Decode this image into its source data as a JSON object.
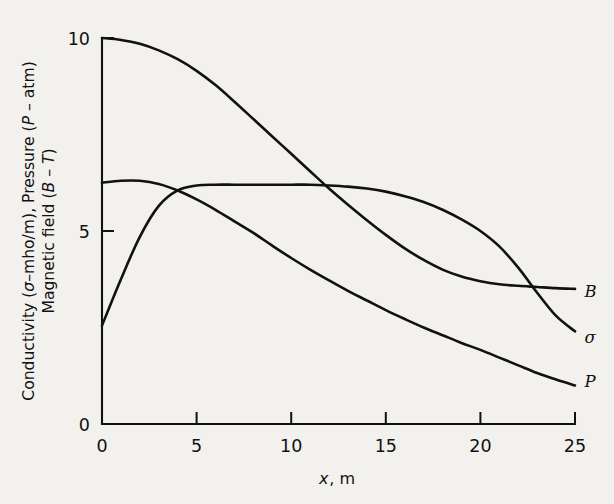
{
  "figure": {
    "background_color": "#f3f1ed",
    "ink_color": "#111111"
  },
  "axis": {
    "x_label_variable": "x",
    "x_label_unit": ", m",
    "x_tick_labels": [
      "0",
      "5",
      "10",
      "15",
      "20",
      "25"
    ],
    "y_tick_labels": [
      "0",
      "5",
      "10"
    ],
    "y_label_line1_part1": "Conductivity (",
    "y_label_line1_sigma": "σ",
    "y_label_line1_part2": "–mho/m), Pressure (",
    "y_label_line1_P": "P",
    "y_label_line1_part3": " – atm)",
    "y_label_line2_part1": "Magnetic field (",
    "y_label_line2_B": "B",
    "y_label_line2_part2": " – ",
    "y_label_line2_T": "T",
    "y_label_line2_part3": ")"
  },
  "curve_labels": {
    "B": "B",
    "sigma": "σ",
    "P": "P"
  },
  "chart_data": {
    "type": "line",
    "title": "",
    "xlabel": "x, m",
    "ylabel": "Conductivity (σ–mho/m), Pressure (P – atm) Magnetic field (B – T)",
    "xlim": [
      0,
      25
    ],
    "ylim": [
      0,
      10
    ],
    "xticks": [
      0,
      5,
      10,
      15,
      20,
      25
    ],
    "yticks": [
      0,
      5,
      10
    ],
    "grid": false,
    "legend": "inline-right-of-curve-ends",
    "series": [
      {
        "name": "B",
        "description": "Magnetic field (B – T)",
        "x": [
          0,
          1,
          2,
          3,
          4,
          5,
          6,
          7,
          8,
          9,
          10,
          11,
          12,
          13,
          14,
          15,
          16,
          17,
          18,
          19,
          20,
          21,
          22,
          23,
          24,
          25
        ],
        "values": [
          10.0,
          9.95,
          9.85,
          9.68,
          9.45,
          9.15,
          8.78,
          8.35,
          7.9,
          7.45,
          7.0,
          6.55,
          6.1,
          5.68,
          5.28,
          4.9,
          4.55,
          4.25,
          4.0,
          3.82,
          3.7,
          3.62,
          3.58,
          3.55,
          3.52,
          3.5
        ]
      },
      {
        "name": "P",
        "description": "Pressure (P – atm)",
        "x": [
          0,
          1,
          2,
          3,
          4,
          5,
          6,
          7,
          8,
          9,
          10,
          11,
          12,
          13,
          14,
          15,
          16,
          17,
          18,
          19,
          20,
          21,
          22,
          23,
          24,
          25
        ],
        "values": [
          6.25,
          6.3,
          6.3,
          6.22,
          6.05,
          5.82,
          5.55,
          5.25,
          4.95,
          4.62,
          4.3,
          4.0,
          3.72,
          3.45,
          3.2,
          2.95,
          2.72,
          2.5,
          2.3,
          2.1,
          1.92,
          1.72,
          1.52,
          1.32,
          1.15,
          1.0
        ]
      },
      {
        "name": "sigma",
        "description": "Conductivity (σ–mho/m)",
        "x": [
          0,
          1,
          2,
          3,
          4,
          5,
          6,
          7,
          8,
          9,
          10,
          11,
          12,
          13,
          14,
          15,
          16,
          17,
          18,
          19,
          20,
          21,
          22,
          23,
          24,
          25
        ],
        "values": [
          2.55,
          3.75,
          4.85,
          5.65,
          6.05,
          6.18,
          6.2,
          6.2,
          6.2,
          6.2,
          6.2,
          6.2,
          6.18,
          6.15,
          6.1,
          6.02,
          5.9,
          5.75,
          5.55,
          5.3,
          5.0,
          4.6,
          4.05,
          3.4,
          2.8,
          2.4
        ]
      }
    ],
    "annotations": [
      {
        "text": "B",
        "x": 25.5,
        "y": 3.3
      },
      {
        "text": "σ",
        "x": 25.5,
        "y": 2.1
      },
      {
        "text": "P",
        "x": 25.5,
        "y": 0.95
      }
    ]
  }
}
